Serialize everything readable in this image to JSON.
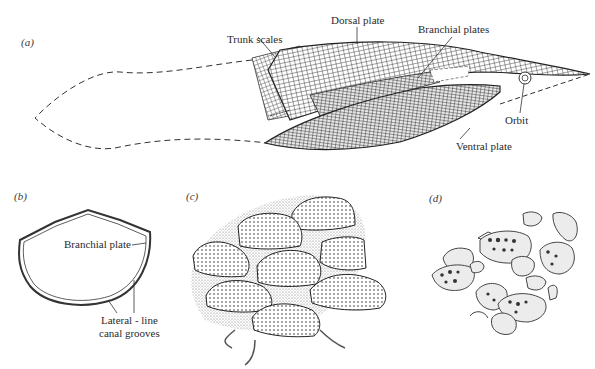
{
  "figure": {
    "panels": [
      {
        "id": "a",
        "label": "(a)",
        "annotations": {
          "trunk_scales": "Trunk scales",
          "dorsal_plate": "Dorsal plate",
          "branchial_plates": "Branchial plates",
          "orbit": "Orbit",
          "ventral_plate": "Ventral plate"
        }
      },
      {
        "id": "b",
        "label": "(b)",
        "annotations": {
          "branchial_plate": "Branchial plate",
          "lateral_line_1": "Lateral - line",
          "lateral_line_2": "canal grooves"
        }
      },
      {
        "id": "c",
        "label": "(c)"
      },
      {
        "id": "d",
        "label": "(d)"
      }
    ],
    "colors": {
      "ink": "#2a2a2a",
      "background": "#ffffff",
      "stipple": "#9a9a9a"
    }
  }
}
